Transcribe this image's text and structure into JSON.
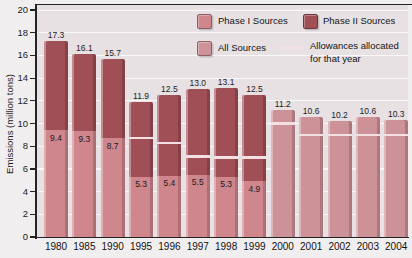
{
  "figure": {
    "bg_color": "#f1eef0",
    "plot_bg_color": "#e7e1e4",
    "grid_color": "#ffffff",
    "axis_color": "#232323"
  },
  "chart_data": {
    "type": "bar",
    "stacked": true,
    "title": "",
    "xlabel": "",
    "ylabel": "Emissions (million tons)",
    "ylim": [
      0,
      20
    ],
    "yticks": [
      0,
      2,
      4,
      6,
      8,
      10,
      12,
      14,
      16,
      18,
      20
    ],
    "grid": "horizontal white gridlines",
    "legend_position": "top-right",
    "categories": [
      "1980",
      "1985",
      "1990",
      "1995",
      "1996",
      "1997",
      "1998",
      "1999",
      "2000",
      "2001",
      "2002",
      "2003",
      "2004"
    ],
    "series": [
      {
        "name": "Phase I Sources",
        "color": "#cf868d",
        "values": [
          9.4,
          9.3,
          8.7,
          5.3,
          5.4,
          5.5,
          5.3,
          4.9,
          null,
          null,
          null,
          null,
          null
        ]
      },
      {
        "name": "Phase II Sources",
        "color": "#a14f57",
        "note": "stacked on top of Phase I; height = total - Phase I",
        "values": [
          7.9,
          6.8,
          7.0,
          6.6,
          7.1,
          7.5,
          7.8,
          7.6,
          null,
          null,
          null,
          null,
          null
        ]
      },
      {
        "name": "All Sources",
        "color": "#cd9198",
        "values": [
          null,
          null,
          null,
          null,
          null,
          null,
          null,
          null,
          11.2,
          10.6,
          10.2,
          10.6,
          10.3
        ]
      },
      {
        "name": "Allowances allocated for that year",
        "color": "#f2e0e2",
        "style": "tick-line",
        "values": [
          null,
          null,
          null,
          8.7,
          8.3,
          7.1,
          7.0,
          7.0,
          10.0,
          9.0,
          9.0,
          9.0,
          9.0
        ]
      }
    ],
    "total_labels": [
      "17.3",
      "16.1",
      "15.7",
      "11.9",
      "12.5",
      "13.0",
      "13.1",
      "12.5",
      "11.2",
      "10.6",
      "10.2",
      "10.6",
      "10.3"
    ],
    "phase1_labels": [
      "9.4",
      "9.3",
      "8.7",
      "5.3",
      "5.4",
      "5.5",
      "5.3",
      "4.9",
      "",
      "",
      "",
      "",
      ""
    ]
  },
  "legend": {
    "row1_col1": "Phase I Sources",
    "row1_col2": "Phase II Sources",
    "row2_col1": "All Sources",
    "row2_col2": "Allowances allocated for that year"
  }
}
